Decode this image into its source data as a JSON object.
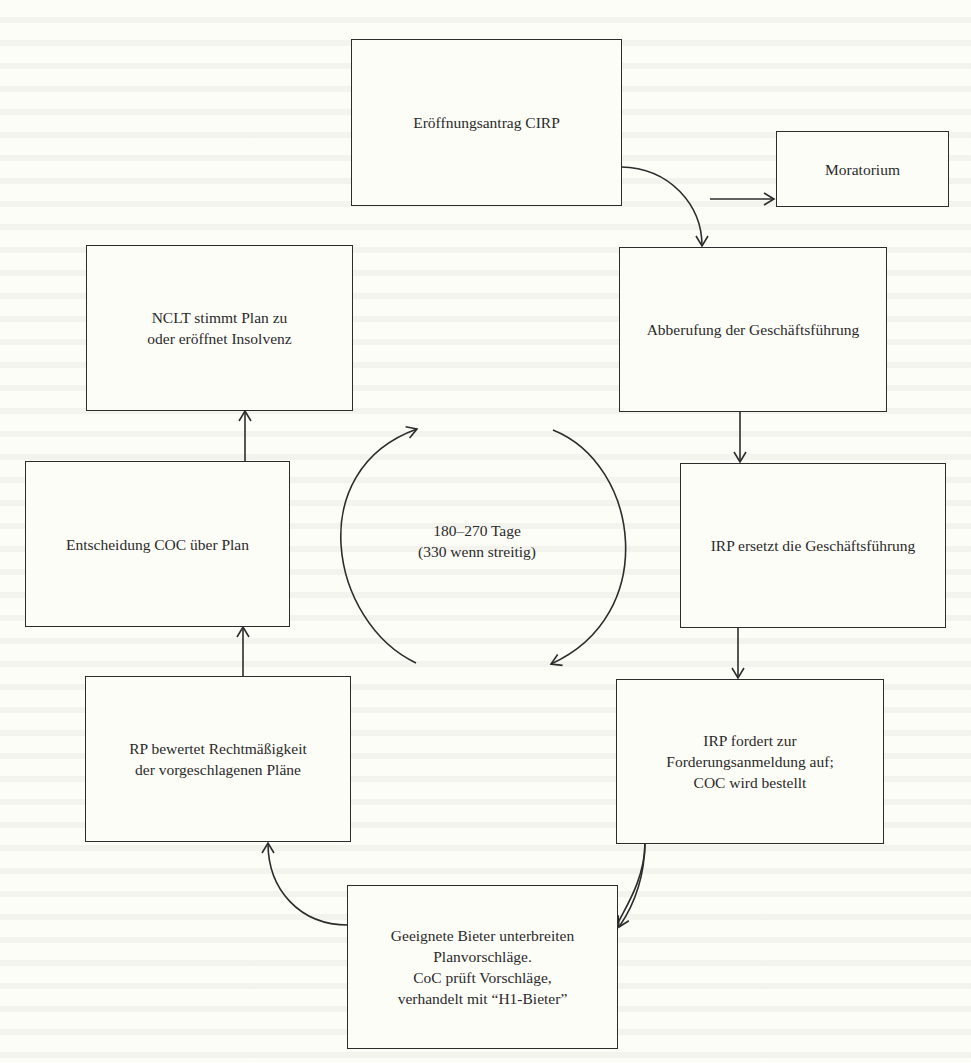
{
  "diagram": {
    "type": "flowchart",
    "title": "",
    "nodes": [
      {
        "id": "opening",
        "label": "Eröffnungsantrag CIRP"
      },
      {
        "id": "moratorium",
        "label": "Moratorium"
      },
      {
        "id": "removal",
        "label": "Abberufung der Geschäftsführung"
      },
      {
        "id": "irp_replaces",
        "label": "IRP ersetzt die Geschäftsführung"
      },
      {
        "id": "irp_claims",
        "label": "IRP fordert zur\nForderungsanmeldung auf;\nCOC wird bestellt"
      },
      {
        "id": "bidders",
        "label": "Geeignete Bieter unterbreiten\nPlanvorschläge.\nCoC prüft Vorschläge,\nverhandelt mit “H1-Bieter”"
      },
      {
        "id": "rp_assess",
        "label": "RP bewertet Rechtmäßigkeit\nder vorgeschlagenen Pläne"
      },
      {
        "id": "coc_decision",
        "label": "Entscheidung COC über Plan"
      },
      {
        "id": "nclt",
        "label": "NCLT stimmt Plan zu\noder eröffnet Insolvenz"
      }
    ],
    "edges": [
      {
        "from": "opening",
        "to": "removal"
      },
      {
        "from": "opening",
        "to": "moratorium"
      },
      {
        "from": "removal",
        "to": "irp_replaces"
      },
      {
        "from": "irp_replaces",
        "to": "irp_claims"
      },
      {
        "from": "irp_claims",
        "to": "bidders"
      },
      {
        "from": "bidders",
        "to": "rp_assess"
      },
      {
        "from": "rp_assess",
        "to": "coc_decision"
      },
      {
        "from": "coc_decision",
        "to": "nclt"
      }
    ],
    "cycle": {
      "label": "180–270 Tage\n(330 wenn streitig)",
      "direction": "clockwise"
    }
  }
}
